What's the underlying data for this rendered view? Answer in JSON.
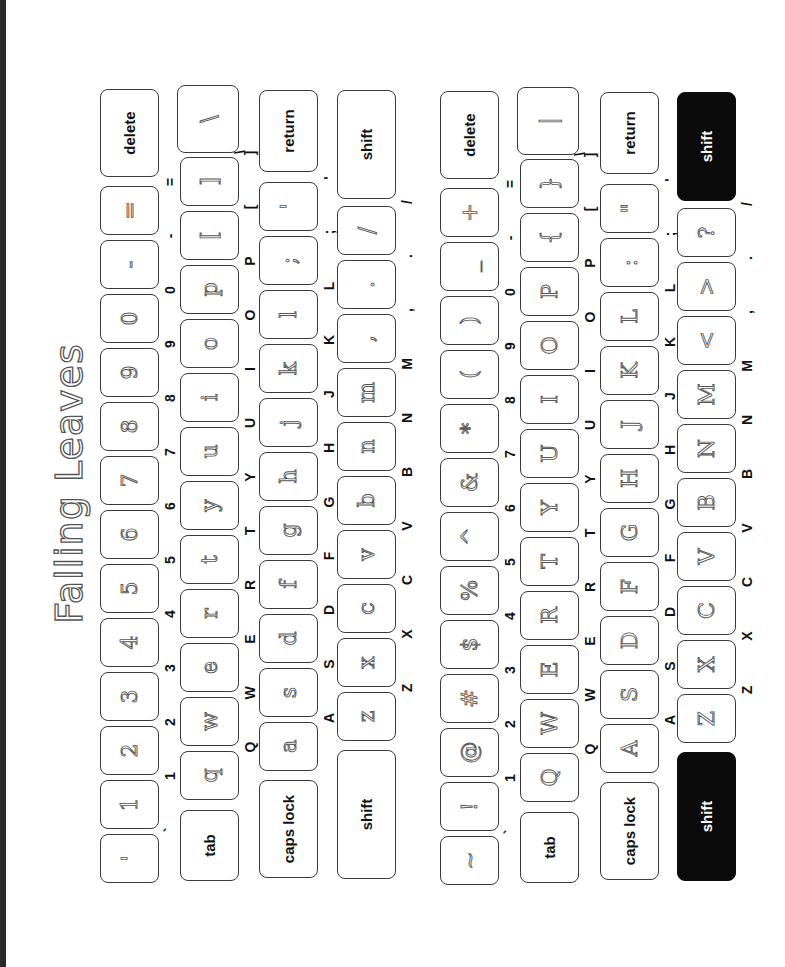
{
  "title": "Falling Leaves",
  "colors": {
    "key_border": "#3a3a3a",
    "shift_active": "#0b0b0b",
    "page_border": "#2a2a2a"
  },
  "keyboards": [
    {
      "name": "lowercase",
      "row1": {
        "keys": [
          {
            "legend": "`",
            "glyph": "'"
          },
          {
            "legend": "1",
            "glyph": "1"
          },
          {
            "legend": "2",
            "glyph": "2"
          },
          {
            "legend": "3",
            "glyph": "3"
          },
          {
            "legend": "4",
            "glyph": "4"
          },
          {
            "legend": "5",
            "glyph": "5"
          },
          {
            "legend": "6",
            "glyph": "6"
          },
          {
            "legend": "7",
            "glyph": "7"
          },
          {
            "legend": "8",
            "glyph": "8"
          },
          {
            "legend": "9",
            "glyph": "9"
          },
          {
            "legend": "0",
            "glyph": "0"
          },
          {
            "legend": "-",
            "glyph": "-"
          },
          {
            "legend": "=",
            "glyph": "="
          }
        ],
        "end_label": "delete"
      },
      "row2": {
        "start_label": "tab",
        "keys": [
          {
            "legend": "Q",
            "glyph": "q"
          },
          {
            "legend": "W",
            "glyph": "w"
          },
          {
            "legend": "E",
            "glyph": "e"
          },
          {
            "legend": "R",
            "glyph": "r"
          },
          {
            "legend": "T",
            "glyph": "t"
          },
          {
            "legend": "Y",
            "glyph": "y"
          },
          {
            "legend": "U",
            "glyph": "u"
          },
          {
            "legend": "I",
            "glyph": "i"
          },
          {
            "legend": "O",
            "glyph": "o"
          },
          {
            "legend": "P",
            "glyph": "p"
          },
          {
            "legend": "[",
            "glyph": "["
          },
          {
            "legend": "]",
            "glyph": "]"
          }
        ],
        "end_key": {
          "legend": "\\",
          "glyph": "\\"
        }
      },
      "row3": {
        "start_label": "caps lock",
        "keys": [
          {
            "legend": "A",
            "glyph": "a"
          },
          {
            "legend": "S",
            "glyph": "s"
          },
          {
            "legend": "D",
            "glyph": "d"
          },
          {
            "legend": "F",
            "glyph": "f"
          },
          {
            "legend": "G",
            "glyph": "g"
          },
          {
            "legend": "H",
            "glyph": "h"
          },
          {
            "legend": "J",
            "glyph": "j"
          },
          {
            "legend": "K",
            "glyph": "k"
          },
          {
            "legend": "L",
            "glyph": "l"
          },
          {
            "legend": ";",
            "glyph": ";"
          },
          {
            "legend": "'",
            "glyph": "'"
          }
        ],
        "end_label": "return"
      },
      "row4": {
        "start_label": "shift",
        "keys": [
          {
            "legend": "Z",
            "glyph": "z"
          },
          {
            "legend": "X",
            "glyph": "x"
          },
          {
            "legend": "C",
            "glyph": "c"
          },
          {
            "legend": "V",
            "glyph": "v"
          },
          {
            "legend": "B",
            "glyph": "b"
          },
          {
            "legend": "N",
            "glyph": "n"
          },
          {
            "legend": "M",
            "glyph": "m"
          },
          {
            "legend": ",",
            "glyph": ","
          },
          {
            "legend": ".",
            "glyph": "."
          },
          {
            "legend": "/",
            "glyph": "/"
          }
        ],
        "end_label": "shift"
      }
    },
    {
      "name": "uppercase",
      "row1": {
        "keys": [
          {
            "legend": "`",
            "glyph": "~"
          },
          {
            "legend": "1",
            "glyph": "!"
          },
          {
            "legend": "2",
            "glyph": "@"
          },
          {
            "legend": "3",
            "glyph": "#"
          },
          {
            "legend": "4",
            "glyph": "$"
          },
          {
            "legend": "5",
            "glyph": "%"
          },
          {
            "legend": "6",
            "glyph": "^"
          },
          {
            "legend": "7",
            "glyph": "&"
          },
          {
            "legend": "8",
            "glyph": "*"
          },
          {
            "legend": "9",
            "glyph": "("
          },
          {
            "legend": "0",
            "glyph": ")"
          },
          {
            "legend": "-",
            "glyph": "_"
          },
          {
            "legend": "=",
            "glyph": "+"
          }
        ],
        "end_label": "delete"
      },
      "row2": {
        "start_label": "tab",
        "keys": [
          {
            "legend": "Q",
            "glyph": "Q"
          },
          {
            "legend": "W",
            "glyph": "W"
          },
          {
            "legend": "E",
            "glyph": "E"
          },
          {
            "legend": "R",
            "glyph": "R"
          },
          {
            "legend": "T",
            "glyph": "T"
          },
          {
            "legend": "Y",
            "glyph": "Y"
          },
          {
            "legend": "U",
            "glyph": "U"
          },
          {
            "legend": "I",
            "glyph": "I"
          },
          {
            "legend": "O",
            "glyph": "O"
          },
          {
            "legend": "P",
            "glyph": "P"
          },
          {
            "legend": "[",
            "glyph": "{"
          },
          {
            "legend": "]",
            "glyph": "}"
          }
        ],
        "end_key": {
          "legend": "\\",
          "glyph": "|"
        }
      },
      "row3": {
        "start_label": "caps lock",
        "keys": [
          {
            "legend": "A",
            "glyph": "A"
          },
          {
            "legend": "S",
            "glyph": "S"
          },
          {
            "legend": "D",
            "glyph": "D"
          },
          {
            "legend": "F",
            "glyph": "F"
          },
          {
            "legend": "G",
            "glyph": "G"
          },
          {
            "legend": "H",
            "glyph": "H"
          },
          {
            "legend": "J",
            "glyph": "J"
          },
          {
            "legend": "K",
            "glyph": "K"
          },
          {
            "legend": "L",
            "glyph": "L"
          },
          {
            "legend": ";",
            "glyph": ":"
          },
          {
            "legend": "'",
            "glyph": "\""
          }
        ],
        "end_label": "return"
      },
      "row4": {
        "start_label": "shift",
        "keys": [
          {
            "legend": "Z",
            "glyph": "Z"
          },
          {
            "legend": "X",
            "glyph": "X"
          },
          {
            "legend": "C",
            "glyph": "C"
          },
          {
            "legend": "V",
            "glyph": "V"
          },
          {
            "legend": "B",
            "glyph": "B"
          },
          {
            "legend": "N",
            "glyph": "N"
          },
          {
            "legend": "M",
            "glyph": "M"
          },
          {
            "legend": ",",
            "glyph": "<"
          },
          {
            "legend": ".",
            "glyph": ">"
          },
          {
            "legend": "/",
            "glyph": "?"
          }
        ],
        "end_label": "shift"
      }
    }
  ]
}
